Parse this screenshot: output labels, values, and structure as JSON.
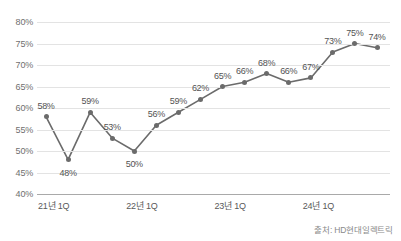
{
  "chart_data": {
    "type": "line",
    "title": "",
    "xlabel": "",
    "ylabel": "",
    "ylim": [
      40,
      80
    ],
    "ytick_step": 5,
    "grid": true,
    "legend": false,
    "yticks": [
      "80%",
      "75%",
      "70%",
      "65%",
      "60%",
      "55%",
      "50%",
      "45%",
      "40%"
    ],
    "ytick_values": [
      80,
      75,
      70,
      65,
      60,
      55,
      50,
      45,
      40
    ],
    "xticks": [
      "21년 1Q",
      "22년 1Q",
      "23년 1Q",
      "24년 1Q"
    ],
    "xtick_indices": [
      0,
      4,
      8,
      12
    ],
    "categories": [
      "21년 1Q",
      "21년 2Q",
      "21년 3Q",
      "21년 4Q",
      "22년 1Q",
      "22년 2Q",
      "22년 3Q",
      "22년 4Q",
      "23년 1Q",
      "23년 2Q",
      "23년 3Q",
      "23년 4Q",
      "24년 1Q",
      "24년 2Q",
      "24년 3Q",
      "24년 4Q"
    ],
    "values": [
      58,
      48,
      59,
      53,
      50,
      56,
      59,
      62,
      65,
      66,
      68,
      66,
      67,
      73,
      75,
      74
    ],
    "point_labels": [
      "58%",
      "48%",
      "59%",
      "53%",
      "50%",
      "56%",
      "59%",
      "62%",
      "65%",
      "66%",
      "68%",
      "66%",
      "67%",
      "73%",
      "75%",
      "74%"
    ],
    "label_positions": [
      "above",
      "below",
      "above",
      "above",
      "below",
      "above",
      "above",
      "above",
      "above",
      "above",
      "above",
      "above",
      "above",
      "above",
      "above",
      "above"
    ],
    "series_color": "#6b6b6b",
    "grid_color": "#e3e3e3",
    "axis_color": "#a9a9a9"
  },
  "source": {
    "text": "출처: HD현대일렉트릭"
  }
}
